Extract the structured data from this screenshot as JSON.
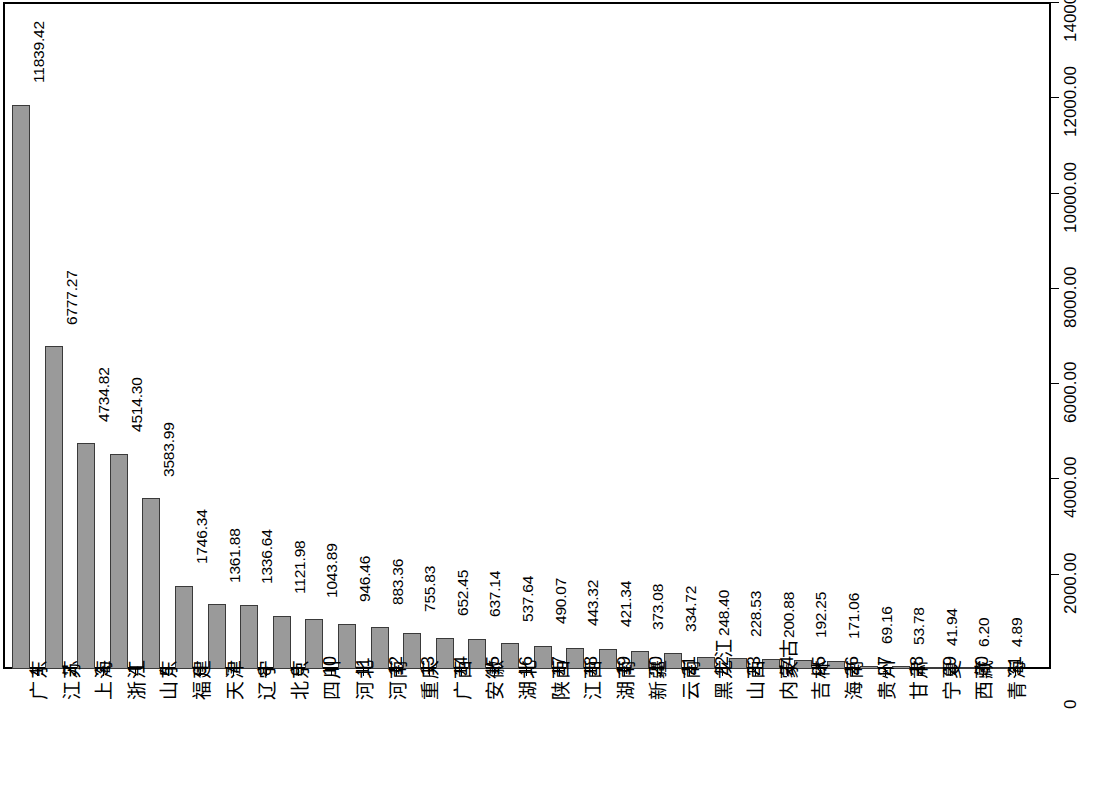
{
  "chart_data": {
    "type": "bar",
    "title": "",
    "subtitle": "",
    "xlabel": "",
    "ylabel": "",
    "grid": false,
    "legend": null,
    "orientation": "vertical",
    "bar_color": "#9a9a9a",
    "bar_border_color": "#3a3a3a",
    "axis_position": "right",
    "ylim": [
      0,
      14000
    ],
    "ytick_labels": [
      "0",
      "2000.00",
      "4000.00",
      "6000.00",
      "8000.00",
      "10000.00",
      "12000.00",
      "14000.00"
    ],
    "ytick_values": [
      0,
      2000,
      4000,
      6000,
      8000,
      10000,
      12000,
      14000
    ],
    "indices": [
      "1",
      "2",
      "3",
      "4",
      "5",
      "6",
      "7",
      "8",
      "9",
      "10",
      "11",
      "12",
      "13",
      "14",
      "15",
      "16",
      "17",
      "18",
      "19",
      "20",
      "21",
      "22",
      "23",
      "24",
      "25",
      "26",
      "27",
      "28",
      "29",
      "30",
      "31"
    ],
    "categories": [
      "广东",
      "江苏",
      "上海",
      "浙江",
      "山东",
      "福建",
      "天津",
      "辽宁",
      "北京",
      "四川",
      "河北",
      "河南",
      "重庆",
      "广西",
      "安徽",
      "湖北",
      "陕西",
      "江西",
      "湖南",
      "新疆",
      "云南",
      "黑龙江",
      "山西",
      "内蒙古",
      "吉林",
      "海南",
      "贵州",
      "甘肃",
      "宁夏",
      "西藏",
      "青海"
    ],
    "values": [
      11839.42,
      6777.27,
      4734.82,
      4514.3,
      3583.99,
      1746.34,
      1361.88,
      1336.64,
      1121.98,
      1043.89,
      946.46,
      883.36,
      755.83,
      652.45,
      637.14,
      537.64,
      490.07,
      443.32,
      421.34,
      373.08,
      334.72,
      248.4,
      228.53,
      200.88,
      192.25,
      171.06,
      69.16,
      53.78,
      41.94,
      6.2,
      4.89
    ],
    "value_labels": [
      "11839.42",
      "6777.27",
      "4734.82",
      "4514.30",
      "3583.99",
      "1746.34",
      "1361.88",
      "1336.64",
      "1121.98",
      "1043.89",
      "946.46",
      "883.36",
      "755.83",
      "652.45",
      "637.14",
      "537.64",
      "490.07",
      "443.32",
      "421.34",
      "373.08",
      "334.72",
      "248.40",
      "228.53",
      "200.88",
      "192.25",
      "171.06",
      "69.16",
      "53.78",
      "41.94",
      "6.20",
      "4.89"
    ]
  }
}
